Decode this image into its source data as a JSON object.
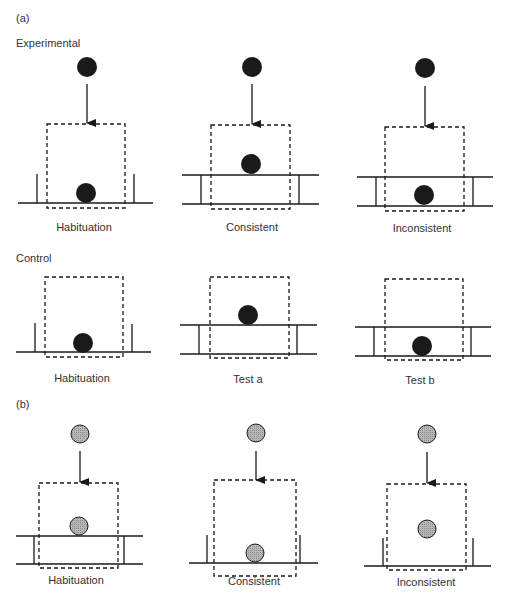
{
  "panel_a": {
    "label": "(a)",
    "experimental": {
      "title": "Experimental",
      "captions": [
        "Habituation",
        "Consistent",
        "Inconsistent"
      ]
    },
    "control": {
      "title": "Control",
      "captions": [
        "Habituation",
        "Test a",
        "Test b"
      ]
    }
  },
  "panel_b": {
    "label": "(b)",
    "captions": [
      "Habituation",
      "Consistent",
      "Inconsistent"
    ]
  },
  "colors": {
    "ball_dark": "#1a1a1a",
    "ball_gray": "#a8a8a8",
    "line": "#1a1a1a"
  }
}
